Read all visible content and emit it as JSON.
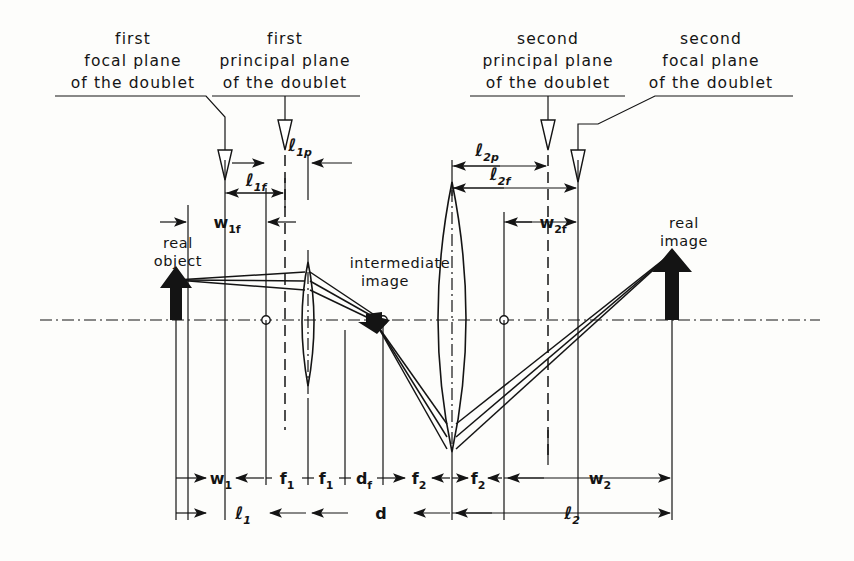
{
  "diagram": {
    "plane_labels": [
      {
        "id": "first-focal-plane",
        "lines": [
          "first",
          "focal plane",
          "of the doublet"
        ]
      },
      {
        "id": "first-principal-plane",
        "lines": [
          "first",
          "principal plane",
          "of the doublet"
        ]
      },
      {
        "id": "second-principal-plane",
        "lines": [
          "second",
          "principal plane",
          "of the doublet"
        ]
      },
      {
        "id": "second-focal-plane",
        "lines": [
          "second",
          "focal plane",
          "of the doublet"
        ]
      }
    ],
    "object_labels": [
      {
        "id": "real-object",
        "lines": [
          "real",
          "object"
        ]
      },
      {
        "id": "intermediate-image",
        "lines": [
          "intermediate",
          "image"
        ]
      },
      {
        "id": "real-image",
        "lines": [
          "real",
          "image"
        ]
      }
    ],
    "dimensions_top": [
      {
        "id": "l1p",
        "base": "ℓ",
        "sub": "1p"
      },
      {
        "id": "l1f",
        "base": "ℓ",
        "sub": "1f"
      },
      {
        "id": "w1f",
        "base": "w",
        "sub": "1f"
      },
      {
        "id": "l2p",
        "base": "ℓ",
        "sub": "2p"
      },
      {
        "id": "l2f",
        "base": "ℓ",
        "sub": "2f"
      },
      {
        "id": "w2f",
        "base": "w",
        "sub": "2f"
      }
    ],
    "dimensions_row1": [
      {
        "id": "w1",
        "base": "w",
        "sub": "1"
      },
      {
        "id": "f1a",
        "base": "f",
        "sub": "1"
      },
      {
        "id": "f1b",
        "base": "f",
        "sub": "1"
      },
      {
        "id": "df",
        "base": "d",
        "sub": "f"
      },
      {
        "id": "f2a",
        "base": "f",
        "sub": "2"
      },
      {
        "id": "f2b",
        "base": "f",
        "sub": "2"
      },
      {
        "id": "w2",
        "base": "w",
        "sub": "2"
      }
    ],
    "dimensions_row2": [
      {
        "id": "l1",
        "base": "ℓ",
        "sub": "1"
      },
      {
        "id": "d",
        "base": "d",
        "sub": ""
      },
      {
        "id": "l2",
        "base": "ℓ",
        "sub": "2"
      }
    ],
    "colors": {
      "ink": "#141414",
      "paper": "#fdfdfb"
    }
  }
}
